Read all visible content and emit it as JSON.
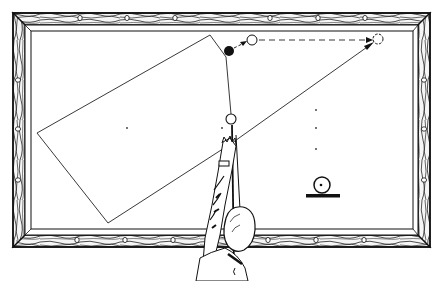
{
  "diagram": {
    "colors": {
      "ink": "#1a1a1a",
      "paper": "#ffffff",
      "wood_light": "#f4f4f4"
    },
    "table": {
      "frame_outer": [
        13,
        13,
        430,
        247
      ],
      "cushion_inner": [
        31,
        31,
        413,
        232
      ],
      "diamonds_top": [
        80,
        127,
        175,
        223,
        270,
        318,
        365
      ],
      "diamonds_bottom": [
        80,
        127,
        175,
        223,
        270,
        318,
        365
      ],
      "diamonds_left": [
        80,
        130,
        180
      ],
      "diamonds_right": [
        80,
        130,
        180
      ]
    },
    "spots": [
      [
        127,
        128
      ],
      [
        222,
        128
      ],
      [
        316,
        110
      ],
      [
        316,
        128
      ],
      [
        316,
        149
      ]
    ],
    "cue_ball": {
      "cx": 231,
      "cy": 119,
      "r": 5
    },
    "object_ball": {
      "cx": 229,
      "cy": 51,
      "r": 5,
      "fill": "solid"
    },
    "contact_ball": {
      "cx": 252,
      "cy": 40,
      "r": 5
    },
    "ghost_ball": {
      "cx": 378,
      "cy": 39,
      "r": 5
    },
    "bank_path": [
      [
        231,
        119
      ],
      [
        226,
        57
      ],
      [
        210,
        35
      ],
      [
        37,
        133
      ],
      [
        108,
        223
      ],
      [
        232,
        143
      ],
      [
        373,
        43
      ]
    ],
    "dashed_path": [
      [
        258,
        40
      ],
      [
        372,
        40
      ]
    ],
    "legend_symbol": {
      "label": "ball-on-rail-symbol",
      "cx": 322,
      "cy": 185,
      "r": 8,
      "bar": [
        306,
        195,
        339,
        198
      ]
    },
    "figure": {
      "label": "player-aiming-cue"
    }
  }
}
